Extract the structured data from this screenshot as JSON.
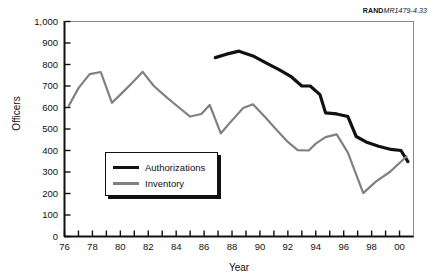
{
  "credit": {
    "brand": "RAND",
    "code": "MR1479-4.33"
  },
  "colors": {
    "authorizations": "#111111",
    "inventory": "#808080",
    "axis": "#111111",
    "background": "#ffffff"
  },
  "legend": {
    "items": [
      {
        "label": "Authorizations",
        "color": "#111111"
      },
      {
        "label": "Inventory",
        "color": "#808080"
      }
    ]
  },
  "chart_data": {
    "type": "line",
    "title": "",
    "subtitle": "",
    "xlabel": "Year",
    "ylabel": "Officers",
    "xlim": [
      76,
      101
    ],
    "ylim": [
      0,
      1000
    ],
    "ytick_values": [
      0,
      100,
      200,
      300,
      400,
      500,
      600,
      700,
      800,
      900,
      1000
    ],
    "ytick_labels": [
      "0",
      "100",
      "200",
      "300",
      "400",
      "500",
      "600",
      "700",
      "800",
      "900",
      "1,000"
    ],
    "xtick_values": [
      76,
      78,
      80,
      82,
      84,
      86,
      88,
      90,
      92,
      94,
      96,
      98,
      100
    ],
    "xtick_labels": [
      "76",
      "78",
      "80",
      "82",
      "84",
      "86",
      "88",
      "90",
      "92",
      "94",
      "96",
      "98",
      "00"
    ],
    "x_minor_tick_interval": 1,
    "grid": false,
    "legend_position": "inside-lower-left",
    "series": [
      {
        "name": "Authorizations",
        "color": "#111111",
        "x": [
          86.8,
          87.6,
          88.5,
          89.5,
          90.5,
          91.4,
          92.2,
          93.0,
          93.6,
          94.3,
          94.7,
          95.5,
          96.3,
          96.9,
          97.6,
          98.5,
          99.4,
          100.1,
          100.6
        ],
        "y": [
          832,
          848,
          862,
          840,
          805,
          775,
          745,
          700,
          700,
          660,
          575,
          570,
          558,
          465,
          440,
          420,
          405,
          400,
          348
        ]
      },
      {
        "name": "Inventory",
        "color": "#808080",
        "x": [
          76.3,
          77.0,
          77.8,
          78.6,
          79.4,
          80.0,
          80.8,
          81.6,
          82.4,
          83.3,
          84.2,
          85.0,
          85.8,
          86.4,
          87.2,
          88.0,
          88.8,
          89.5,
          90.3,
          91.2,
          92.0,
          92.7,
          93.5,
          94.0,
          94.7,
          95.5,
          96.3,
          97.4,
          98.3,
          99.3,
          100.5
        ],
        "y": [
          607,
          690,
          755,
          765,
          622,
          660,
          712,
          766,
          700,
          648,
          600,
          558,
          570,
          612,
          480,
          540,
          598,
          615,
          560,
          495,
          440,
          402,
          400,
          432,
          462,
          475,
          390,
          202,
          255,
          300,
          372
        ]
      }
    ],
    "annotations": [
      {
        "text": "lines cross near 2000 at about 350 officers",
        "x": 100.4,
        "y": 355
      }
    ]
  }
}
